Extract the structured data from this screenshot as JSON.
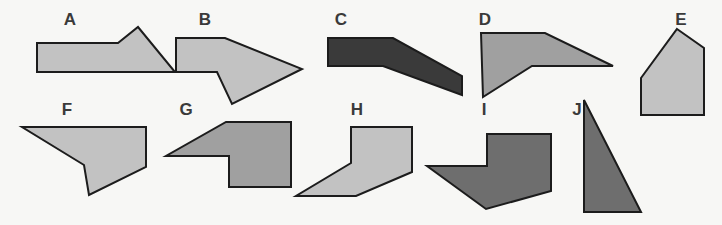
{
  "figure": {
    "background_color": "#f7f7f5",
    "outline_color": "#1c1c1c",
    "width": 722,
    "height": 225,
    "palette": {
      "light_gray": "#c2c2c2",
      "medium_gray": "#a0a0a0",
      "dark_gray": "#6e6e6e",
      "near_black": "#3a3a3a",
      "label_color": "#3a3a3a"
    }
  },
  "shapes": [
    {
      "id": "A",
      "label": "A",
      "label_x": 70,
      "label_y": 25,
      "fill": "#c2c2c2",
      "description": "flat-topped wedge with raised peak on right",
      "points": "37,43 118,43 138,27 175,72 37,72"
    },
    {
      "id": "B",
      "label": "B",
      "label_x": 205,
      "label_y": 25,
      "fill": "#c2c2c2",
      "description": "right-pointing arrow with lower notch",
      "points": "176,38 225,38 302,69 232,104 217,72 176,72"
    },
    {
      "id": "C",
      "label": "C",
      "label_x": 341,
      "label_y": 25,
      "fill": "#3a3a3a",
      "description": "bent dark band angling down to the right",
      "points": "328,38 393,38 462,76 462,95 383,66 328,66"
    },
    {
      "id": "D",
      "label": "D",
      "label_x": 485,
      "label_y": 25,
      "fill": "#a0a0a0",
      "description": "chevron wedge pointing right",
      "points": "481,33 545,33 613,66 532,66 483,97"
    },
    {
      "id": "E",
      "label": "E",
      "label_x": 681,
      "label_y": 25,
      "fill": "#c2c2c2",
      "description": "pentagon, house-like",
      "points": "677,29 704,48 704,115 641,115 641,78"
    },
    {
      "id": "F",
      "label": "F",
      "label_x": 67,
      "label_y": 115,
      "fill": "#c2c2c2",
      "description": "wedge with notch at lower left",
      "points": "22,127 146,127 146,167 89,195 84,165 22,127"
    },
    {
      "id": "G",
      "label": "G",
      "label_x": 186,
      "label_y": 115,
      "fill": "#a0a0a0",
      "description": "notched wedge pointing left",
      "points": "226,122 291,122 291,187 229,187 229,156 166,156"
    },
    {
      "id": "H",
      "label": "H",
      "label_x": 357,
      "label_y": 115,
      "fill": "#c2c2c2",
      "description": "flag-like shape with long lower ramp",
      "points": "351,127 412,127 412,172 356,196 296,196 351,163"
    },
    {
      "id": "I",
      "label": "I",
      "label_x": 484,
      "label_y": 115,
      "fill": "#6e6e6e",
      "description": "down-left pointing arrow with notch",
      "points": "487,134 551,134 551,191 486,209 427,166 487,166"
    },
    {
      "id": "J",
      "label": "J",
      "label_x": 577,
      "label_y": 115,
      "fill": "#6e6e6e",
      "description": "right triangle with vertical left edge",
      "points": "584,100 584,212 641,212"
    }
  ]
}
